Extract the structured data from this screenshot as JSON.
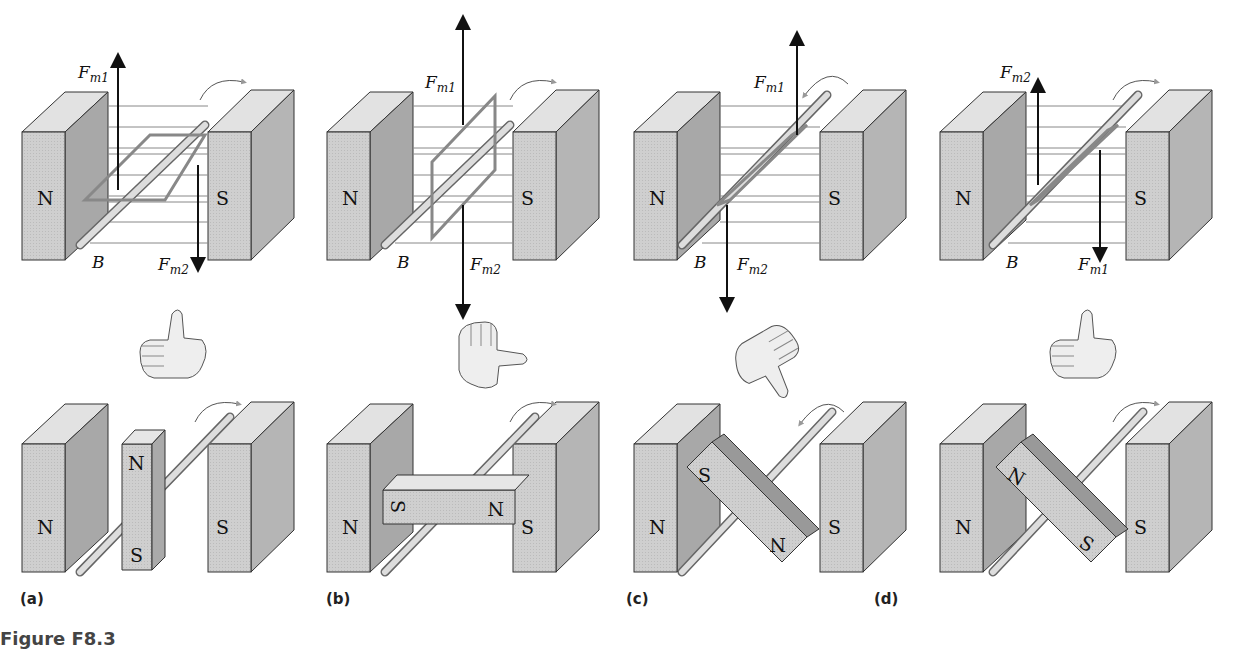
{
  "figure": {
    "caption": "Figure F8.3",
    "panels": [
      {
        "label": "(a)",
        "forces": {
          "top": "F",
          "top_sub": "m1",
          "bottom": "F",
          "bottom_sub": "m2"
        },
        "field": "B",
        "hand": "thumb-up",
        "rotor_top": "N",
        "rotor_bottom": "S",
        "rotation": "clockwise"
      },
      {
        "label": "(b)",
        "forces": {
          "top": "F",
          "top_sub": "m1",
          "bottom": "F",
          "bottom_sub": "m2"
        },
        "field": "B",
        "hand": "thumb-sideways",
        "rotor_left": "S",
        "rotor_right": "N",
        "rotation": "clockwise"
      },
      {
        "label": "(c)",
        "forces": {
          "top": "F",
          "top_sub": "m1",
          "bottom": "F",
          "bottom_sub": "m2"
        },
        "field": "B",
        "hand": "thumb-down",
        "rotor_top": "S",
        "rotor_bottom": "N",
        "rotation": "counterclockwise"
      },
      {
        "label": "(d)",
        "forces": {
          "top": "F",
          "top_sub": "m2",
          "bottom": "F",
          "bottom_sub": "m1"
        },
        "field": "B",
        "hand": "thumb-up",
        "rotor_top": "N",
        "rotor_bottom": "S",
        "rotation": "clockwise"
      }
    ],
    "stator": {
      "left_pole": "N",
      "right_pole": "S"
    }
  }
}
